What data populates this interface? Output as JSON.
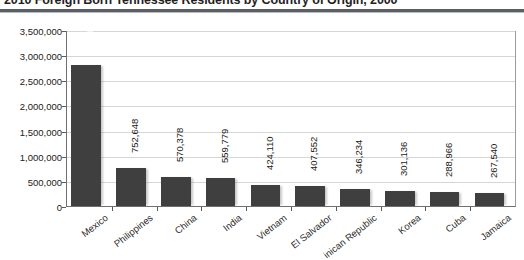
{
  "chart_data": {
    "type": "bar",
    "title": "2010 Foreign Born Tennessee Residents by Country of Origin, 2000",
    "xlabel": "",
    "ylabel": "",
    "ylim": [
      0,
      3500000
    ],
    "grid": true,
    "legend": false,
    "orientation": "vertical",
    "bar_color": "#3f3f3f",
    "categories": [
      "Mexico",
      "Philippines",
      "China",
      "India",
      "Vietnam",
      "El Salvador",
      "Dominican Republic",
      "Korea",
      "Cuba",
      "Jamaica"
    ],
    "values": [
      2812498,
      752648,
      570378,
      559779,
      424110,
      407552,
      346234,
      301136,
      288966,
      267540
    ],
    "value_labels": [
      "2,812,498",
      "752,648",
      "570,378",
      "559,779",
      "424,110",
      "407,552",
      "346,234",
      "301,136",
      "288,966",
      "267,540"
    ],
    "ytick_values": [
      0,
      500000,
      1000000,
      1500000,
      2000000,
      2500000,
      3000000,
      3500000
    ],
    "ytick_labels": [
      "0",
      "500,000",
      "1,000,000",
      "1,500,000",
      "2,000,000",
      "2,500,000",
      "3,000,000",
      "3,500,000"
    ],
    "xtick_labels_display": [
      "Mexico",
      "Philippines",
      "China",
      "India",
      "Vietnam",
      "El Salvador",
      "inican Republic",
      "Korea",
      "Cuba",
      "Jamaica"
    ]
  }
}
